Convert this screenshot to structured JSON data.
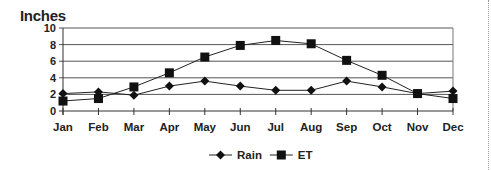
{
  "chart_data": {
    "type": "line",
    "title": "Inches",
    "xlabel": "",
    "ylabel": "Inches",
    "ylim": [
      0,
      10
    ],
    "yticks": [
      0,
      2,
      4,
      6,
      8,
      10
    ],
    "grid": true,
    "legend_position": "bottom",
    "categories": [
      "Jan",
      "Feb",
      "Mar",
      "Apr",
      "May",
      "Jun",
      "Jul",
      "Aug",
      "Sep",
      "Oct",
      "Nov",
      "Dec"
    ],
    "series": [
      {
        "name": "Rain",
        "marker": "diamond",
        "values": [
          2.1,
          2.3,
          1.9,
          3.0,
          3.6,
          3.0,
          2.5,
          2.5,
          3.6,
          2.9,
          2.1,
          2.4
        ]
      },
      {
        "name": "ET",
        "marker": "square",
        "values": [
          1.2,
          1.5,
          2.9,
          4.6,
          6.5,
          7.9,
          8.5,
          8.1,
          6.1,
          4.3,
          2.1,
          1.5
        ]
      }
    ]
  },
  "colors": {
    "line": "#222222",
    "grid": "#444444",
    "marker": "#111111"
  }
}
